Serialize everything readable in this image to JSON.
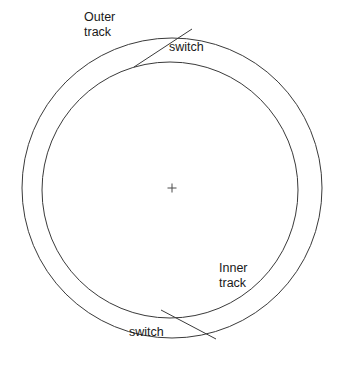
{
  "diagram": {
    "background_color": "#ffffff",
    "stroke_color": "#3a3a3a",
    "text_color": "#1a1a1a",
    "labels": {
      "outer_track": "Outer\ntrack",
      "inner_track": "Inner\ntrack",
      "switch_top": "switch",
      "switch_bottom": "switch"
    },
    "geometry": {
      "outer_circle": {
        "cx": 172,
        "cy": 188,
        "r": 150
      },
      "inner_circle": {
        "cx": 170,
        "cy": 190,
        "r": 128
      },
      "center_mark": {
        "x": 172,
        "y": 188,
        "size": 9
      },
      "switch_top": {
        "x1": 134,
        "y1": 67,
        "x2": 192,
        "y2": 29
      },
      "switch_bottom": {
        "x1": 161,
        "y1": 310,
        "x2": 216,
        "y2": 339
      }
    }
  }
}
